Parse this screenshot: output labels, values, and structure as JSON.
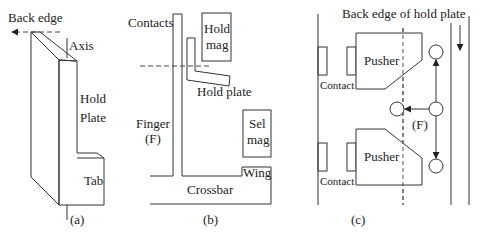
{
  "figure": {
    "panels": [
      {
        "id": "a",
        "caption": "(a)",
        "labels": {
          "back_edge": "Back edge",
          "axis": "Axis",
          "hold": "Hold",
          "plate": "Plate",
          "tab": "Tab"
        }
      },
      {
        "id": "b",
        "caption": "(b)",
        "labels": {
          "contacts": "Contacts",
          "hold": "Hold",
          "mag": "mag",
          "hold_plate": "Hold plate",
          "finger": "Finger",
          "finger_f": "(F)",
          "sel": "Sel",
          "sel_mag": "mag",
          "wing": "Wing",
          "crossbar": "Crossbar"
        }
      },
      {
        "id": "c",
        "caption": "(c)",
        "labels": {
          "back_edge_of_hold_plate": "Back edge of hold plate",
          "pusher_top": "Pusher",
          "pusher_bottom": "Pusher",
          "contact_top": "Contact",
          "contact_bottom": "Contact",
          "finger_f": "(F)"
        }
      }
    ],
    "colors": {
      "line": "#333333",
      "text": "#222222",
      "background": "#ffffff"
    }
  }
}
